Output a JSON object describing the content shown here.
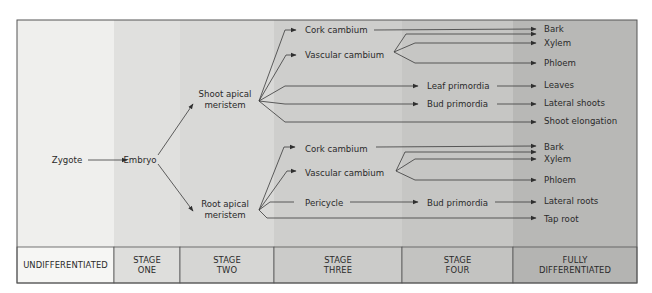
{
  "diagram": {
    "frame": {
      "x": 17,
      "y": 20,
      "width": 620,
      "height": 263,
      "header_top": 247
    },
    "columns": [
      {
        "id": "undifferentiated",
        "label_lines": [
          "UNDIFFERENTIATED"
        ],
        "x0": 17,
        "x1": 114,
        "fill": "#efefed",
        "header_fill": "#f6f6f4"
      },
      {
        "id": "stage-one",
        "label_lines": [
          "STAGE",
          "ONE"
        ],
        "x0": 114,
        "x1": 180,
        "fill": "#e0e0de",
        "header_fill": "#dededc"
      },
      {
        "id": "stage-two",
        "label_lines": [
          "STAGE",
          "TWO"
        ],
        "x0": 180,
        "x1": 274,
        "fill": "#d9d9d7",
        "header_fill": "#d6d6d4"
      },
      {
        "id": "stage-three",
        "label_lines": [
          "STAGE",
          "THREE"
        ],
        "x0": 274,
        "x1": 402,
        "fill": "#cececc",
        "header_fill": "#cbcbc9"
      },
      {
        "id": "stage-four",
        "label_lines": [
          "STAGE",
          "FOUR"
        ],
        "x0": 402,
        "x1": 513,
        "fill": "#c6c6c4",
        "header_fill": "#c3c3c1"
      },
      {
        "id": "fully-differentiated",
        "label_lines": [
          "FULLY",
          "DIFFERENTIATED"
        ],
        "x0": 513,
        "x1": 637,
        "fill": "#b8b8b6",
        "header_fill": "#b4b4b2"
      }
    ],
    "nodes": [
      {
        "id": "zygote",
        "lines": [
          "Zygote"
        ],
        "x": 67,
        "y": 160,
        "anchor": "middle"
      },
      {
        "id": "embryo",
        "lines": [
          "Embryo"
        ],
        "x": 140,
        "y": 160,
        "anchor": "middle"
      },
      {
        "id": "shoot-apical-meristem",
        "lines": [
          "Shoot apical",
          "meristem"
        ],
        "x": 225,
        "y": 99,
        "anchor": "middle"
      },
      {
        "id": "root-apical-meristem",
        "lines": [
          "Root apical",
          "meristem"
        ],
        "x": 225,
        "y": 209,
        "anchor": "middle"
      },
      {
        "id": "shoot-cork-cambium",
        "lines": [
          "Cork cambium"
        ],
        "x": 305,
        "y": 30,
        "anchor": "start"
      },
      {
        "id": "shoot-vascular-cambium",
        "lines": [
          "Vascular cambium"
        ],
        "x": 305,
        "y": 55,
        "anchor": "start"
      },
      {
        "id": "leaf-primordia",
        "lines": [
          "Leaf primordia"
        ],
        "x": 427,
        "y": 86,
        "anchor": "start"
      },
      {
        "id": "shoot-bud-primordia",
        "lines": [
          "Bud primordia"
        ],
        "x": 427,
        "y": 104,
        "anchor": "start"
      },
      {
        "id": "shoot-bark",
        "lines": [
          "Bark"
        ],
        "x": 544,
        "y": 29,
        "anchor": "start"
      },
      {
        "id": "shoot-xylem",
        "lines": [
          "Xylem"
        ],
        "x": 544,
        "y": 43,
        "anchor": "start"
      },
      {
        "id": "shoot-phloem",
        "lines": [
          "Phloem"
        ],
        "x": 544,
        "y": 63,
        "anchor": "start"
      },
      {
        "id": "leaves",
        "lines": [
          "Leaves"
        ],
        "x": 544,
        "y": 85,
        "anchor": "start"
      },
      {
        "id": "lateral-shoots",
        "lines": [
          "Lateral shoots"
        ],
        "x": 544,
        "y": 103,
        "anchor": "start"
      },
      {
        "id": "shoot-elongation",
        "lines": [
          "Shoot elongation"
        ],
        "x": 544,
        "y": 121,
        "anchor": "start"
      },
      {
        "id": "root-cork-cambium",
        "lines": [
          "Cork cambium"
        ],
        "x": 305,
        "y": 149,
        "anchor": "start"
      },
      {
        "id": "root-vascular-cambium",
        "lines": [
          "Vascular cambium"
        ],
        "x": 305,
        "y": 173,
        "anchor": "start"
      },
      {
        "id": "pericycle",
        "lines": [
          "Pericycle"
        ],
        "x": 305,
        "y": 203,
        "anchor": "start"
      },
      {
        "id": "root-bud-primordia",
        "lines": [
          "Bud primordia"
        ],
        "x": 427,
        "y": 203,
        "anchor": "start"
      },
      {
        "id": "root-bark",
        "lines": [
          "Bark"
        ],
        "x": 544,
        "y": 147,
        "anchor": "start"
      },
      {
        "id": "root-xylem",
        "lines": [
          "Xylem"
        ],
        "x": 544,
        "y": 159,
        "anchor": "start"
      },
      {
        "id": "root-phloem",
        "lines": [
          "Phloem"
        ],
        "x": 544,
        "y": 180,
        "anchor": "start"
      },
      {
        "id": "lateral-roots",
        "lines": [
          "Lateral roots"
        ],
        "x": 544,
        "y": 201,
        "anchor": "start"
      },
      {
        "id": "tap-root",
        "lines": [
          "Tap root"
        ],
        "x": 544,
        "y": 219,
        "anchor": "start"
      }
    ],
    "edges": [
      {
        "id": "zygote-to-embryo",
        "points": [
          [
            88,
            160
          ],
          [
            127,
            160
          ]
        ],
        "arrow": true
      },
      {
        "id": "embryo-to-shoot",
        "points": [
          [
            158,
            155
          ],
          [
            193,
            104
          ]
        ],
        "arrow": true
      },
      {
        "id": "embryo-to-root",
        "points": [
          [
            158,
            164
          ],
          [
            193,
            211
          ]
        ],
        "arrow": true
      },
      {
        "id": "shoot-to-cork",
        "points": [
          [
            259,
            101
          ],
          [
            285,
            30
          ],
          [
            296,
            30
          ]
        ],
        "arrow": true
      },
      {
        "id": "shoot-to-vascular",
        "points": [
          [
            259,
            101
          ],
          [
            286,
            55
          ],
          [
            296,
            55
          ]
        ],
        "arrow": true
      },
      {
        "id": "shoot-to-leaf-primordia",
        "points": [
          [
            259,
            101
          ],
          [
            285,
            86
          ],
          [
            418,
            86
          ]
        ],
        "arrow": true
      },
      {
        "id": "shoot-to-bud-primordia",
        "points": [
          [
            259,
            101
          ],
          [
            285,
            104
          ],
          [
            418,
            104
          ]
        ],
        "arrow": true
      },
      {
        "id": "shoot-to-elongation",
        "points": [
          [
            259,
            101
          ],
          [
            285,
            122
          ],
          [
            536,
            122
          ]
        ],
        "arrow": true
      },
      {
        "id": "shoot-cork-to-bark",
        "points": [
          [
            374,
            30
          ],
          [
            536,
            29
          ]
        ],
        "arrow": true
      },
      {
        "id": "shoot-vasc-to-bark",
        "points": [
          [
            394,
            52
          ],
          [
            406,
            34
          ],
          [
            536,
            34
          ]
        ],
        "arrow": true
      },
      {
        "id": "shoot-vasc-to-xylem",
        "points": [
          [
            394,
            52
          ],
          [
            415,
            43
          ],
          [
            536,
            43
          ]
        ],
        "arrow": true
      },
      {
        "id": "shoot-vasc-to-phloem",
        "points": [
          [
            394,
            52
          ],
          [
            415,
            63
          ],
          [
            536,
            63
          ]
        ],
        "arrow": true
      },
      {
        "id": "leaf-primordia-to-leaves",
        "points": [
          [
            497,
            86
          ],
          [
            536,
            86
          ]
        ],
        "arrow": true
      },
      {
        "id": "bud-primordia-to-lateral-shoots",
        "points": [
          [
            497,
            104
          ],
          [
            536,
            104
          ]
        ],
        "arrow": true
      },
      {
        "id": "root-to-cork",
        "points": [
          [
            259,
            210
          ],
          [
            284,
            147
          ],
          [
            295,
            147
          ]
        ],
        "arrow": true
      },
      {
        "id": "root-to-vascular",
        "points": [
          [
            259,
            210
          ],
          [
            287,
            171
          ],
          [
            296,
            171
          ]
        ],
        "arrow": true
      },
      {
        "id": "root-to-pericycle",
        "points": [
          [
            259,
            210
          ],
          [
            270,
            202
          ],
          [
            294,
            202
          ]
        ],
        "arrow": false
      },
      {
        "id": "root-to-tap-root",
        "points": [
          [
            259,
            210
          ],
          [
            267,
            218
          ],
          [
            536,
            218
          ]
        ],
        "arrow": true
      },
      {
        "id": "root-cork-to-bark",
        "points": [
          [
            376,
            147
          ],
          [
            536,
            146
          ]
        ],
        "arrow": true
      },
      {
        "id": "root-vasc-to-bark",
        "points": [
          [
            396,
            171
          ],
          [
            405,
            152
          ],
          [
            536,
            152
          ]
        ],
        "arrow": true
      },
      {
        "id": "root-vasc-to-xylem",
        "points": [
          [
            396,
            171
          ],
          [
            415,
            159
          ],
          [
            536,
            159
          ]
        ],
        "arrow": true
      },
      {
        "id": "root-vasc-to-phloem",
        "points": [
          [
            396,
            171
          ],
          [
            415,
            180
          ],
          [
            536,
            180
          ]
        ],
        "arrow": true
      },
      {
        "id": "pericycle-to-bud-primordia",
        "points": [
          [
            350,
            202
          ],
          [
            418,
            202
          ]
        ],
        "arrow": true
      },
      {
        "id": "bud-primordia-to-lateral-roots",
        "points": [
          [
            495,
            202
          ],
          [
            536,
            202
          ]
        ],
        "arrow": true
      }
    ],
    "colors": {
      "frame_stroke": "#555555",
      "line": "#3a3a3a",
      "text": "#2a2a2a"
    }
  }
}
